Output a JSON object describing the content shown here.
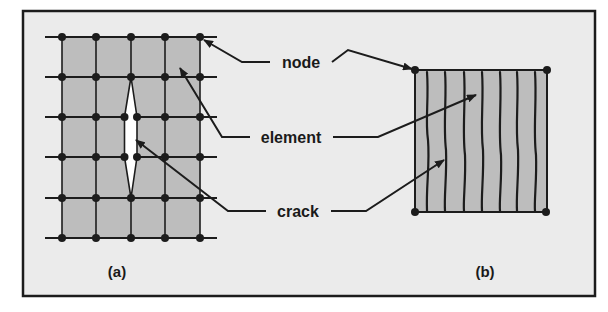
{
  "figure": {
    "background": "#ebebeb",
    "frame_color": "#1c1c1c",
    "fill_color": "#bdbdbd",
    "line_color": "#1c1c1c",
    "labels": {
      "node": "node",
      "element": "element",
      "crack": "crack"
    },
    "panels": [
      {
        "id": "a",
        "caption": "(a)",
        "description": "Finite element mesh with discrete crack opening between elements"
      },
      {
        "id": "b",
        "caption": "(b)",
        "description": "Single element with smeared cracks"
      }
    ]
  }
}
